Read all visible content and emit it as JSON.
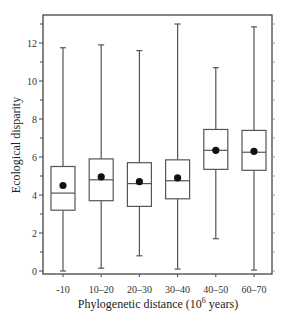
{
  "chart_data": {
    "type": "box",
    "title": "",
    "xlabel": "Phylogenetic distance (10^6 years)",
    "xlabel_parts": {
      "pre": "Phylogenetic distance (10",
      "sup": "6",
      "post": " years)"
    },
    "ylabel": "Ecological disparity",
    "ylim": [
      0,
      13.5
    ],
    "yticks": [
      0,
      2,
      4,
      6,
      8,
      10,
      12
    ],
    "categories": [
      "-10",
      "10–20",
      "20–30",
      "30–40",
      "40–50",
      "60–70"
    ],
    "series": [
      {
        "name": "-10",
        "whisker_low": 0.0,
        "q1": 3.2,
        "median": 4.1,
        "q3": 5.5,
        "whisker_high": 11.75,
        "mean": 4.5
      },
      {
        "name": "10–20",
        "whisker_low": 0.15,
        "q1": 3.7,
        "median": 4.8,
        "q3": 5.9,
        "whisker_high": 11.9,
        "mean": 4.95
      },
      {
        "name": "20–30",
        "whisker_low": 0.8,
        "q1": 3.4,
        "median": 4.6,
        "q3": 5.7,
        "whisker_high": 11.6,
        "mean": 4.7
      },
      {
        "name": "30–40",
        "whisker_low": 0.1,
        "q1": 3.8,
        "median": 4.75,
        "q3": 5.85,
        "whisker_high": 13.0,
        "mean": 4.9
      },
      {
        "name": "40–50",
        "whisker_low": 1.7,
        "q1": 5.35,
        "median": 6.35,
        "q3": 7.45,
        "whisker_high": 10.7,
        "mean": 6.35
      },
      {
        "name": "60–70",
        "whisker_low": 0.05,
        "q1": 5.3,
        "median": 6.25,
        "q3": 7.4,
        "whisker_high": 12.85,
        "mean": 6.3
      }
    ],
    "grid": false,
    "legend": null,
    "colors": {
      "line": "#555555",
      "mean_marker": "#111111",
      "frame": "#444444"
    }
  }
}
